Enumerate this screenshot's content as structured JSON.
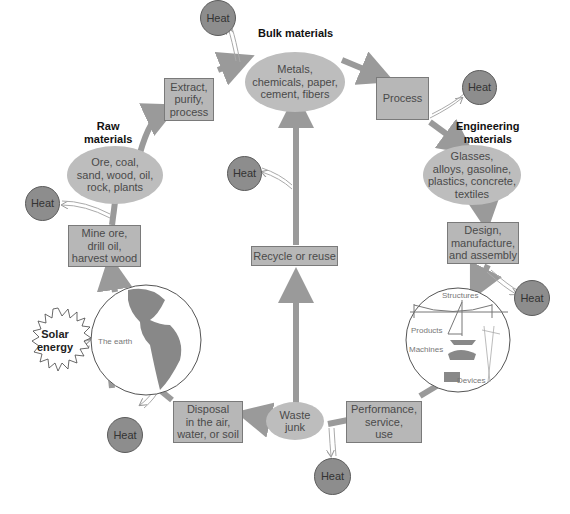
{
  "diagram": {
    "title_labels": {
      "bulk": "Bulk materials",
      "raw": "Raw\nmaterials",
      "engineering": "Engineering\nmaterials"
    },
    "nodes": {
      "bulk_materials": "Metals,\nchemicals, paper,\ncement, fibers",
      "extract": "Extract,\npurify,\nprocess",
      "raw_materials": "Ore, coal,\nsand, wood, oil,\nrock, plants",
      "mine": "Mine ore,\ndrill oil,\nharvest wood",
      "process": "Process",
      "engineering_materials": "Glasses,\nalloys, gasoline,\nplastics, concrete,\ntextiles",
      "design": "Design,\nmanufacture,\nand assembly",
      "recycle": "Recycle or reuse",
      "performance": "Performance,\nservice,\nuse",
      "waste": "Waste\njunk",
      "disposal": "Disposal\nin the air,\nwater, or soil"
    },
    "earth": {
      "label": "The earth",
      "solar": "Solar\nenergy"
    },
    "products_circle": {
      "structures": "Structures",
      "products": "Products",
      "machines": "Machines",
      "devices": "Devices"
    },
    "heat_label": "Heat",
    "colors": {
      "arrow": "#9a9a9a",
      "box_fill": "#b7b7b7",
      "ellipse_fill": "#bdbdbd",
      "heat_fill": "#8d8d8d"
    }
  }
}
